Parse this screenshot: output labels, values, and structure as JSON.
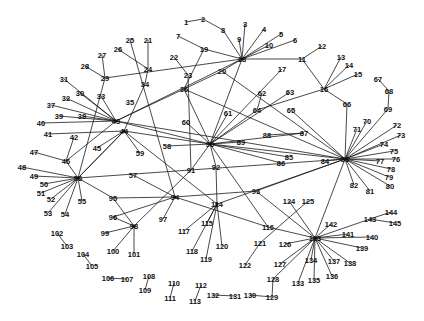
{
  "diagram": {
    "type": "network-graph",
    "hubs": [
      "18",
      "43",
      "44",
      "56",
      "83",
      "90",
      "94",
      "98",
      "114",
      "123"
    ],
    "nodes": [
      {
        "id": "1",
        "x": 186,
        "y": 22
      },
      {
        "id": "2",
        "x": 203,
        "y": 19
      },
      {
        "id": "8",
        "x": 223,
        "y": 30
      },
      {
        "id": "3",
        "x": 245,
        "y": 24
      },
      {
        "id": "4",
        "x": 264,
        "y": 29
      },
      {
        "id": "5",
        "x": 281,
        "y": 34
      },
      {
        "id": "6",
        "x": 295,
        "y": 40
      },
      {
        "id": "9",
        "x": 239,
        "y": 39
      },
      {
        "id": "10",
        "x": 269,
        "y": 45
      },
      {
        "id": "7",
        "x": 178,
        "y": 36
      },
      {
        "id": "19",
        "x": 204,
        "y": 49
      },
      {
        "id": "18",
        "x": 242,
        "y": 59
      },
      {
        "id": "25",
        "x": 130,
        "y": 40
      },
      {
        "id": "21",
        "x": 148,
        "y": 40
      },
      {
        "id": "26",
        "x": 118,
        "y": 49
      },
      {
        "id": "22",
        "x": 174,
        "y": 57
      },
      {
        "id": "27",
        "x": 102,
        "y": 55
      },
      {
        "id": "24",
        "x": 148,
        "y": 69
      },
      {
        "id": "28",
        "x": 85,
        "y": 66
      },
      {
        "id": "29",
        "x": 105,
        "y": 78
      },
      {
        "id": "23",
        "x": 188,
        "y": 75
      },
      {
        "id": "20",
        "x": 222,
        "y": 71
      },
      {
        "id": "34",
        "x": 145,
        "y": 84
      },
      {
        "id": "31",
        "x": 64,
        "y": 79
      },
      {
        "id": "36",
        "x": 184,
        "y": 89
      },
      {
        "id": "30",
        "x": 80,
        "y": 93
      },
      {
        "id": "33",
        "x": 101,
        "y": 96
      },
      {
        "id": "32",
        "x": 66,
        "y": 98
      },
      {
        "id": "35",
        "x": 130,
        "y": 102
      },
      {
        "id": "37",
        "x": 51,
        "y": 105
      },
      {
        "id": "39",
        "x": 59,
        "y": 116
      },
      {
        "id": "38",
        "x": 82,
        "y": 116
      },
      {
        "id": "40",
        "x": 41,
        "y": 123
      },
      {
        "id": "43",
        "x": 116,
        "y": 121
      },
      {
        "id": "44",
        "x": 124,
        "y": 131
      },
      {
        "id": "41",
        "x": 48,
        "y": 134
      },
      {
        "id": "42",
        "x": 74,
        "y": 137
      },
      {
        "id": "45",
        "x": 97,
        "y": 148
      },
      {
        "id": "46",
        "x": 66,
        "y": 161
      },
      {
        "id": "47",
        "x": 34,
        "y": 152
      },
      {
        "id": "48",
        "x": 22,
        "y": 167
      },
      {
        "id": "49",
        "x": 34,
        "y": 176
      },
      {
        "id": "56",
        "x": 78,
        "y": 178
      },
      {
        "id": "50",
        "x": 44,
        "y": 184
      },
      {
        "id": "51",
        "x": 41,
        "y": 193
      },
      {
        "id": "52",
        "x": 51,
        "y": 199
      },
      {
        "id": "53",
        "x": 48,
        "y": 213
      },
      {
        "id": "54",
        "x": 65,
        "y": 214
      },
      {
        "id": "55",
        "x": 82,
        "y": 201
      },
      {
        "id": "57",
        "x": 133,
        "y": 175
      },
      {
        "id": "58",
        "x": 167,
        "y": 146
      },
      {
        "id": "59",
        "x": 140,
        "y": 153
      },
      {
        "id": "60",
        "x": 186,
        "y": 122
      },
      {
        "id": "61",
        "x": 228,
        "y": 113
      },
      {
        "id": "62",
        "x": 262,
        "y": 93
      },
      {
        "id": "63",
        "x": 290,
        "y": 92
      },
      {
        "id": "64",
        "x": 257,
        "y": 110
      },
      {
        "id": "65",
        "x": 291,
        "y": 110
      },
      {
        "id": "66",
        "x": 347,
        "y": 104
      },
      {
        "id": "67",
        "x": 378,
        "y": 79
      },
      {
        "id": "68",
        "x": 389,
        "y": 91
      },
      {
        "id": "69",
        "x": 388,
        "y": 109
      },
      {
        "id": "70",
        "x": 367,
        "y": 121
      },
      {
        "id": "71",
        "x": 357,
        "y": 129
      },
      {
        "id": "72",
        "x": 397,
        "y": 125
      },
      {
        "id": "73",
        "x": 401,
        "y": 135
      },
      {
        "id": "74",
        "x": 384,
        "y": 144
      },
      {
        "id": "75",
        "x": 394,
        "y": 151
      },
      {
        "id": "76",
        "x": 396,
        "y": 159
      },
      {
        "id": "77",
        "x": 380,
        "y": 161
      },
      {
        "id": "78",
        "x": 391,
        "y": 169
      },
      {
        "id": "79",
        "x": 389,
        "y": 177
      },
      {
        "id": "80",
        "x": 390,
        "y": 186
      },
      {
        "id": "81",
        "x": 370,
        "y": 191
      },
      {
        "id": "82",
        "x": 354,
        "y": 185
      },
      {
        "id": "83",
        "x": 345,
        "y": 159
      },
      {
        "id": "84",
        "x": 325,
        "y": 161
      },
      {
        "id": "85",
        "x": 289,
        "y": 157
      },
      {
        "id": "86",
        "x": 281,
        "y": 163
      },
      {
        "id": "87",
        "x": 304,
        "y": 133
      },
      {
        "id": "88",
        "x": 267,
        "y": 135
      },
      {
        "id": "89",
        "x": 241,
        "y": 142
      },
      {
        "id": "90",
        "x": 210,
        "y": 144
      },
      {
        "id": "91",
        "x": 191,
        "y": 170
      },
      {
        "id": "92",
        "x": 216,
        "y": 167
      },
      {
        "id": "93",
        "x": 256,
        "y": 191
      },
      {
        "id": "94",
        "x": 175,
        "y": 197
      },
      {
        "id": "95",
        "x": 113,
        "y": 198
      },
      {
        "id": "96",
        "x": 113,
        "y": 217
      },
      {
        "id": "97",
        "x": 163,
        "y": 219
      },
      {
        "id": "98",
        "x": 134,
        "y": 226
      },
      {
        "id": "99",
        "x": 105,
        "y": 233
      },
      {
        "id": "100",
        "x": 113,
        "y": 251
      },
      {
        "id": "101",
        "x": 134,
        "y": 254
      },
      {
        "id": "102",
        "x": 57,
        "y": 233
      },
      {
        "id": "103",
        "x": 67,
        "y": 246
      },
      {
        "id": "104",
        "x": 83,
        "y": 254
      },
      {
        "id": "105",
        "x": 92,
        "y": 266
      },
      {
        "id": "106",
        "x": 108,
        "y": 278
      },
      {
        "id": "107",
        "x": 127,
        "y": 279
      },
      {
        "id": "108",
        "x": 149,
        "y": 276
      },
      {
        "id": "109",
        "x": 145,
        "y": 290
      },
      {
        "id": "110",
        "x": 174,
        "y": 283
      },
      {
        "id": "111",
        "x": 170,
        "y": 298
      },
      {
        "id": "112",
        "x": 201,
        "y": 285
      },
      {
        "id": "113",
        "x": 195,
        "y": 301
      },
      {
        "id": "114",
        "x": 217,
        "y": 204
      },
      {
        "id": "115",
        "x": 207,
        "y": 223
      },
      {
        "id": "116",
        "x": 268,
        "y": 227
      },
      {
        "id": "117",
        "x": 184,
        "y": 231
      },
      {
        "id": "118",
        "x": 192,
        "y": 251
      },
      {
        "id": "119",
        "x": 206,
        "y": 259
      },
      {
        "id": "120",
        "x": 222,
        "y": 246
      },
      {
        "id": "121",
        "x": 260,
        "y": 243
      },
      {
        "id": "122",
        "x": 245,
        "y": 265
      },
      {
        "id": "123",
        "x": 315,
        "y": 238
      },
      {
        "id": "124",
        "x": 289,
        "y": 201
      },
      {
        "id": "125",
        "x": 308,
        "y": 201
      },
      {
        "id": "126",
        "x": 285,
        "y": 244
      },
      {
        "id": "127",
        "x": 280,
        "y": 264
      },
      {
        "id": "128",
        "x": 273,
        "y": 279
      },
      {
        "id": "129",
        "x": 272,
        "y": 297
      },
      {
        "id": "130",
        "x": 250,
        "y": 295
      },
      {
        "id": "131",
        "x": 235,
        "y": 296
      },
      {
        "id": "132",
        "x": 213,
        "y": 295
      },
      {
        "id": "133",
        "x": 298,
        "y": 283
      },
      {
        "id": "134",
        "x": 311,
        "y": 260
      },
      {
        "id": "135",
        "x": 314,
        "y": 280
      },
      {
        "id": "136",
        "x": 332,
        "y": 276
      },
      {
        "id": "137",
        "x": 334,
        "y": 261
      },
      {
        "id": "138",
        "x": 350,
        "y": 263
      },
      {
        "id": "139",
        "x": 362,
        "y": 248
      },
      {
        "id": "140",
        "x": 372,
        "y": 237
      },
      {
        "id": "141",
        "x": 348,
        "y": 234
      },
      {
        "id": "142",
        "x": 331,
        "y": 224
      },
      {
        "id": "143",
        "x": 370,
        "y": 219
      },
      {
        "id": "144",
        "x": 391,
        "y": 212
      },
      {
        "id": "145",
        "x": 395,
        "y": 223
      },
      {
        "id": "11",
        "x": 302,
        "y": 59
      },
      {
        "id": "12",
        "x": 322,
        "y": 46
      },
      {
        "id": "13",
        "x": 341,
        "y": 57
      },
      {
        "id": "14",
        "x": 349,
        "y": 65
      },
      {
        "id": "15",
        "x": 358,
        "y": 74
      },
      {
        "id": "16",
        "x": 324,
        "y": 89
      },
      {
        "id": "17",
        "x": 282,
        "y": 69
      }
    ],
    "edges": [
      [
        "1",
        "2"
      ],
      [
        "2",
        "8"
      ],
      [
        "8",
        "18"
      ],
      [
        "3",
        "18"
      ],
      [
        "4",
        "18"
      ],
      [
        "5",
        "18"
      ],
      [
        "6",
        "18"
      ],
      [
        "9",
        "18"
      ],
      [
        "10",
        "18"
      ],
      [
        "7",
        "19"
      ],
      [
        "19",
        "36"
      ],
      [
        "18",
        "19"
      ],
      [
        "18",
        "11"
      ],
      [
        "11",
        "12"
      ],
      [
        "11",
        "16"
      ],
      [
        "16",
        "13"
      ],
      [
        "16",
        "14"
      ],
      [
        "16",
        "15"
      ],
      [
        "16",
        "66"
      ],
      [
        "66",
        "83"
      ],
      [
        "16",
        "64"
      ],
      [
        "17",
        "90"
      ],
      [
        "18",
        "20"
      ],
      [
        "20",
        "36"
      ],
      [
        "18",
        "90"
      ],
      [
        "18",
        "43"
      ],
      [
        "25",
        "94"
      ],
      [
        "21",
        "24"
      ],
      [
        "26",
        "24"
      ],
      [
        "24",
        "34"
      ],
      [
        "34",
        "44"
      ],
      [
        "27",
        "29"
      ],
      [
        "28",
        "29"
      ],
      [
        "29",
        "56"
      ],
      [
        "29",
        "18"
      ],
      [
        "22",
        "23"
      ],
      [
        "23",
        "91"
      ],
      [
        "36",
        "43"
      ],
      [
        "36",
        "90"
      ],
      [
        "36",
        "83"
      ],
      [
        "31",
        "43"
      ],
      [
        "30",
        "43"
      ],
      [
        "33",
        "43"
      ],
      [
        "32",
        "43"
      ],
      [
        "37",
        "43"
      ],
      [
        "39",
        "43"
      ],
      [
        "38",
        "43"
      ],
      [
        "40",
        "43"
      ],
      [
        "41",
        "44"
      ],
      [
        "42",
        "46"
      ],
      [
        "43",
        "90"
      ],
      [
        "43",
        "83"
      ],
      [
        "43",
        "46"
      ],
      [
        "44",
        "90"
      ],
      [
        "44",
        "56"
      ],
      [
        "44",
        "114"
      ],
      [
        "45",
        "44"
      ],
      [
        "46",
        "47"
      ],
      [
        "46",
        "56"
      ],
      [
        "48",
        "56"
      ],
      [
        "49",
        "56"
      ],
      [
        "50",
        "56"
      ],
      [
        "51",
        "56"
      ],
      [
        "52",
        "56"
      ],
      [
        "53",
        "56"
      ],
      [
        "54",
        "56"
      ],
      [
        "55",
        "56"
      ],
      [
        "56",
        "95"
      ],
      [
        "56",
        "44"
      ],
      [
        "56",
        "83"
      ],
      [
        "57",
        "94"
      ],
      [
        "58",
        "90"
      ],
      [
        "59",
        "44"
      ],
      [
        "60",
        "90"
      ],
      [
        "61",
        "90"
      ],
      [
        "62",
        "64"
      ],
      [
        "63",
        "90"
      ],
      [
        "64",
        "90"
      ],
      [
        "65",
        "83"
      ],
      [
        "67",
        "68"
      ],
      [
        "68",
        "69"
      ],
      [
        "69",
        "83"
      ],
      [
        "70",
        "83"
      ],
      [
        "71",
        "83"
      ],
      [
        "72",
        "83"
      ],
      [
        "73",
        "83"
      ],
      [
        "74",
        "83"
      ],
      [
        "75",
        "83"
      ],
      [
        "76",
        "83"
      ],
      [
        "77",
        "83"
      ],
      [
        "78",
        "83"
      ],
      [
        "79",
        "83"
      ],
      [
        "80",
        "83"
      ],
      [
        "81",
        "83"
      ],
      [
        "82",
        "83"
      ],
      [
        "84",
        "83"
      ],
      [
        "85",
        "90"
      ],
      [
        "86",
        "90"
      ],
      [
        "87",
        "90"
      ],
      [
        "88",
        "87"
      ],
      [
        "89",
        "90"
      ],
      [
        "90",
        "83"
      ],
      [
        "90",
        "91"
      ],
      [
        "90",
        "92"
      ],
      [
        "90",
        "116"
      ],
      [
        "91",
        "98"
      ],
      [
        "92",
        "114"
      ],
      [
        "93",
        "83"
      ],
      [
        "93",
        "94"
      ],
      [
        "94",
        "95"
      ],
      [
        "94",
        "96"
      ],
      [
        "94",
        "97"
      ],
      [
        "94",
        "116"
      ],
      [
        "95",
        "98"
      ],
      [
        "96",
        "98"
      ],
      [
        "98",
        "99"
      ],
      [
        "98",
        "100"
      ],
      [
        "98",
        "101"
      ],
      [
        "102",
        "103"
      ],
      [
        "104",
        "105"
      ],
      [
        "106",
        "107"
      ],
      [
        "108",
        "109"
      ],
      [
        "110",
        "111"
      ],
      [
        "112",
        "113"
      ],
      [
        "114",
        "83"
      ],
      [
        "114",
        "115"
      ],
      [
        "114",
        "117"
      ],
      [
        "114",
        "118"
      ],
      [
        "114",
        "119"
      ],
      [
        "114",
        "120"
      ],
      [
        "116",
        "123"
      ],
      [
        "121",
        "122"
      ],
      [
        "121",
        "125"
      ],
      [
        "123",
        "83"
      ],
      [
        "123",
        "124"
      ],
      [
        "123",
        "126"
      ],
      [
        "123",
        "127"
      ],
      [
        "123",
        "128"
      ],
      [
        "128",
        "129"
      ],
      [
        "129",
        "130"
      ],
      [
        "131",
        "132"
      ],
      [
        "123",
        "133"
      ],
      [
        "123",
        "134"
      ],
      [
        "123",
        "135"
      ],
      [
        "123",
        "136"
      ],
      [
        "123",
        "137"
      ],
      [
        "123",
        "138"
      ],
      [
        "123",
        "139"
      ],
      [
        "123",
        "140"
      ],
      [
        "123",
        "141"
      ],
      [
        "123",
        "142"
      ],
      [
        "123",
        "143"
      ],
      [
        "143",
        "144"
      ],
      [
        "143",
        "145"
      ],
      [
        "20",
        "83"
      ],
      [
        "93",
        "123"
      ]
    ]
  }
}
